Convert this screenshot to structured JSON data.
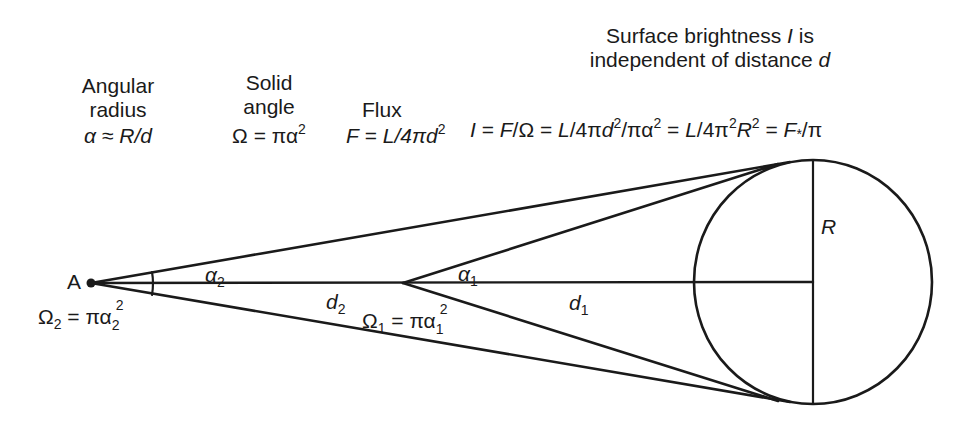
{
  "headers": {
    "angular_radius": {
      "line1": "Angular",
      "line2": "radius",
      "formula_alpha": "α",
      "formula_approx": " ≈ ",
      "formula_rhs": "R/d"
    },
    "solid_angle": {
      "line1": "Solid",
      "line2": "angle",
      "formula_lhs": "Ω = πα",
      "formula_exp": "2"
    },
    "flux": {
      "line1": "Flux",
      "formula_lhs": "F",
      "formula_mid": " = ",
      "formula_rhs": "L/4πd",
      "formula_exp": "2"
    },
    "surface_brightness": {
      "line1_pre": "Surface brightness ",
      "line1_var": "I",
      "line1_post": " is",
      "line2_pre": "independent of distance ",
      "line2_var": "d",
      "formula": {
        "p1": "I",
        "p2": " = ",
        "p3": "F",
        "p4": "/Ω = ",
        "p5": "L",
        "p6": "/4π",
        "p7": "d",
        "p8": "2",
        "p9": "/πα",
        "p10": "2",
        "p11": " = ",
        "p12": "L",
        "p13": "/4π",
        "p14": "2",
        "p15": "R",
        "p16": "2",
        "p17": " = ",
        "p18": "F",
        "p19": "*",
        "p20": "/π"
      }
    }
  },
  "diagram_labels": {
    "point_a": "A",
    "omega2": {
      "lhs": "Ω",
      "lhs_sub": "2",
      "mid": " = πα",
      "sub": "2",
      "sup": "2"
    },
    "alpha2": {
      "sym": "α",
      "sub": "2"
    },
    "d2": {
      "sym": "d",
      "sub": "2"
    },
    "alpha1": {
      "sym": "α",
      "sub": "1"
    },
    "omega1": {
      "lhs": "Ω",
      "lhs_sub": "1",
      "mid": " = πα",
      "sub": "1",
      "sup": "2"
    },
    "d1": {
      "sym": "d",
      "sub": "1"
    },
    "radius": "R"
  },
  "geometry": {
    "observer_a": [
      91,
      283
    ],
    "observer_near": [
      403,
      283
    ],
    "sphere_center": [
      813,
      282
    ],
    "sphere_radius": 121,
    "tangent_top": [
      765,
      165
    ],
    "tangent_bottom": [
      765,
      400
    ],
    "line_color": "#1a1a1a"
  }
}
